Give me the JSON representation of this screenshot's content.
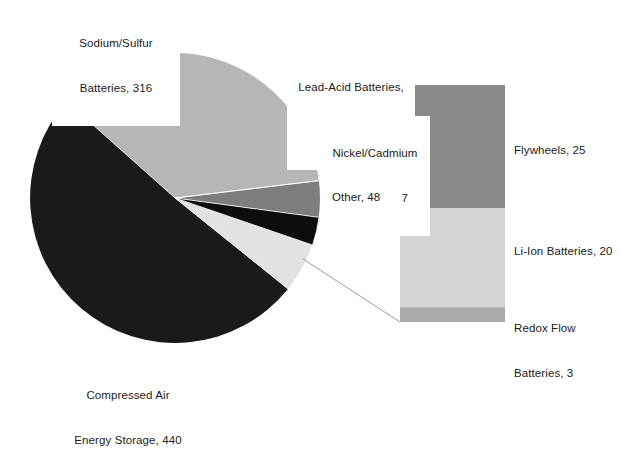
{
  "chart_data": {
    "type": "pie",
    "title": "",
    "subtitle": "",
    "xlabel": "",
    "ylabel": "",
    "variant": "bar-of-pie",
    "units": "MW",
    "legend": "none (direct data labels)",
    "grid": false,
    "total": 866,
    "categories": [
      "Compressed Air Energy Storage",
      "Sodium/Sulfur Batteries",
      "Lead-Acid Batteries",
      "Nickel/Cadmium Batteries",
      "Other"
    ],
    "values": [
      440,
      316,
      35,
      27,
      48
    ],
    "colors": [
      "#1a1a1a",
      "#b6b6b6",
      "#7d7d7d",
      "#0d0d0d",
      "#e2e2e2"
    ],
    "slices": [
      {
        "label": "Compressed Air\nEnergy Storage, 440",
        "name": "Compressed Air Energy Storage",
        "value": 440,
        "color": "#1a1a1a",
        "percent": 50.8
      },
      {
        "label": "Sodium/Sulfur\nBatteries, 316",
        "name": "Sodium/Sulfur Batteries",
        "value": 316,
        "color": "#b6b6b6",
        "percent": 36.5
      },
      {
        "label": "Lead-Acid Batteries,\n35",
        "name": "Lead-Acid Batteries",
        "value": 35,
        "color": "#7d7d7d",
        "percent": 4.0
      },
      {
        "label": "Nickel/Cadmium\nBatteries, 27",
        "name": "Nickel/Cadmium Batteries",
        "value": 27,
        "color": "#0d0d0d",
        "percent": 3.1
      },
      {
        "label": "Other, 48",
        "name": "Other",
        "value": 48,
        "color": "#e2e2e2",
        "percent": 5.5
      }
    ],
    "secondary_plot": {
      "type": "stacked_bar",
      "of_category": "Other",
      "of_value": 48,
      "categories": [
        "Flywheels",
        "Li-Ion Batteries",
        "Redox Flow Batteries"
      ],
      "values": [
        25,
        20,
        3
      ],
      "colors": [
        "#8a8a8a",
        "#d4d4d4",
        "#aaaaaa"
      ],
      "segments": [
        {
          "label": "Flywheels, 25",
          "name": "Flywheels",
          "value": 25,
          "color": "#8a8a8a"
        },
        {
          "label": "Li-Ion Batteries, 20",
          "name": "Li-Ion Batteries",
          "value": 20,
          "color": "#d4d4d4"
        },
        {
          "label": "Redox Flow\nBatteries, 3",
          "name": "Redox Flow Batteries",
          "value": 3,
          "color": "#aaaaaa"
        }
      ]
    }
  },
  "labels": {
    "sodium_sulfur_line1": "Sodium/Sulfur",
    "sodium_sulfur_line2": "Batteries, 316",
    "lead_acid_line1": "Lead-Acid Batteries,",
    "lead_acid_line2": "35",
    "nickel_cadmium_line1": "Nickel/Cadmium",
    "nickel_cadmium_line2": "Batteries, 27",
    "other": "Other, 48",
    "compressed_air_line1": "Compressed Air",
    "compressed_air_line2": "Energy Storage, 440",
    "flywheels": "Flywheels, 25",
    "liion": "Li-Ion Batteries, 20",
    "redox_line1": "Redox Flow",
    "redox_line2": "Batteries, 3"
  }
}
